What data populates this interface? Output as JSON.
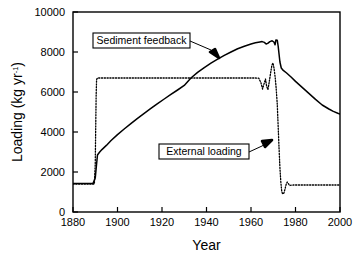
{
  "chart_data": {
    "type": "line",
    "title": "",
    "xlabel": "Year",
    "ylabel": "Loading (kg yr-1)",
    "ylabel_base": "Loading (kg yr",
    "ylabel_sup": "-1",
    "ylabel_close": ")",
    "xlim": [
      1880,
      2000
    ],
    "ylim": [
      0,
      10000
    ],
    "xticks": [
      1880,
      1900,
      1920,
      1940,
      1960,
      1980,
      2000
    ],
    "yticks": [
      0,
      2000,
      4000,
      6000,
      8000,
      10000
    ],
    "grid": false,
    "legend": "none",
    "annotations": [
      {
        "name": "sediment-feedback",
        "label": "Sediment feedback",
        "box_x": 93,
        "box_y": 33,
        "box_w": 97,
        "box_h": 15,
        "leader": "190,41 L 211,50 L 219,58",
        "arrow": "219,58 210,52 215,49"
      },
      {
        "name": "external-loading",
        "label": "External loading",
        "box_x": 159,
        "box_y": 144,
        "box_w": 90,
        "box_h": 15,
        "leader": "249,152 L 262,146 L 272,140",
        "arrow": "272,140 262,141 265,147"
      }
    ],
    "series": [
      {
        "name": "Sediment feedback",
        "style": "solid",
        "color": "#000000",
        "points": [
          [
            1880,
            1420
          ],
          [
            1884,
            1420
          ],
          [
            1887,
            1420
          ],
          [
            1889,
            1430
          ],
          [
            1890,
            1700
          ],
          [
            1890.6,
            2400
          ],
          [
            1891,
            2850
          ],
          [
            1892,
            3000
          ],
          [
            1893,
            3120
          ],
          [
            1895,
            3330
          ],
          [
            1897,
            3560
          ],
          [
            1900,
            3870
          ],
          [
            1903,
            4150
          ],
          [
            1906,
            4420
          ],
          [
            1909,
            4680
          ],
          [
            1912,
            4930
          ],
          [
            1915,
            5180
          ],
          [
            1918,
            5420
          ],
          [
            1921,
            5650
          ],
          [
            1924,
            5880
          ],
          [
            1927,
            6100
          ],
          [
            1930,
            6330
          ],
          [
            1933,
            6700
          ],
          [
            1936,
            6980
          ],
          [
            1939,
            7220
          ],
          [
            1942,
            7440
          ],
          [
            1945,
            7640
          ],
          [
            1948,
            7830
          ],
          [
            1951,
            8000
          ],
          [
            1954,
            8160
          ],
          [
            1957,
            8290
          ],
          [
            1960,
            8400
          ],
          [
            1962,
            8460
          ],
          [
            1964,
            8500
          ],
          [
            1965,
            8520
          ],
          [
            1966,
            8480
          ],
          [
            1966.8,
            8400
          ],
          [
            1967.5,
            8430
          ],
          [
            1968.5,
            8520
          ],
          [
            1969.5,
            8560
          ],
          [
            1970.3,
            8500
          ],
          [
            1970.8,
            8360
          ],
          [
            1971.2,
            8600
          ],
          [
            1971.8,
            8590
          ],
          [
            1972.2,
            8300
          ],
          [
            1972.6,
            7900
          ],
          [
            1973,
            7500
          ],
          [
            1973.6,
            7200
          ],
          [
            1974.5,
            7080
          ],
          [
            1976,
            6950
          ],
          [
            1978,
            6750
          ],
          [
            1980,
            6530
          ],
          [
            1983,
            6230
          ],
          [
            1986,
            5930
          ],
          [
            1989,
            5630
          ],
          [
            1992,
            5350
          ],
          [
            1995,
            5150
          ],
          [
            1997,
            5030
          ],
          [
            1999,
            4940
          ],
          [
            2000,
            4900
          ]
        ]
      },
      {
        "name": "External loading",
        "style": "dotted",
        "color": "#000000",
        "points": [
          [
            1880,
            1400
          ],
          [
            1885,
            1400
          ],
          [
            1888,
            1400
          ],
          [
            1889.6,
            1400
          ],
          [
            1890,
            2400
          ],
          [
            1890.2,
            4200
          ],
          [
            1890.4,
            5800
          ],
          [
            1890.6,
            6620
          ],
          [
            1891,
            6700
          ],
          [
            1895,
            6700
          ],
          [
            1900,
            6700
          ],
          [
            1910,
            6700
          ],
          [
            1920,
            6700
          ],
          [
            1930,
            6700
          ],
          [
            1940,
            6700
          ],
          [
            1950,
            6700
          ],
          [
            1958,
            6700
          ],
          [
            1962,
            6700
          ],
          [
            1963.5,
            6690
          ],
          [
            1964.5,
            6450
          ],
          [
            1965.2,
            6150
          ],
          [
            1965.9,
            6420
          ],
          [
            1966.5,
            6650
          ],
          [
            1967,
            6300
          ],
          [
            1967.6,
            6120
          ],
          [
            1968.2,
            6500
          ],
          [
            1968.8,
            6950
          ],
          [
            1969.4,
            7350
          ],
          [
            1969.9,
            7450
          ],
          [
            1970.4,
            7150
          ],
          [
            1970.9,
            6700
          ],
          [
            1971.3,
            6200
          ],
          [
            1971.8,
            5400
          ],
          [
            1972.2,
            4300
          ],
          [
            1972.6,
            3200
          ],
          [
            1973,
            2200
          ],
          [
            1973.4,
            1500
          ],
          [
            1973.8,
            1050
          ],
          [
            1974.2,
            900
          ],
          [
            1974.8,
            950
          ],
          [
            1975.3,
            1150
          ],
          [
            1975.8,
            1380
          ],
          [
            1976.3,
            1500
          ],
          [
            1976.8,
            1420
          ],
          [
            1977.4,
            1320
          ],
          [
            1978,
            1340
          ],
          [
            1979,
            1350
          ],
          [
            1982,
            1350
          ],
          [
            1986,
            1350
          ],
          [
            1990,
            1350
          ],
          [
            1994,
            1350
          ],
          [
            1998,
            1350
          ],
          [
            2000,
            1350
          ]
        ]
      }
    ]
  },
  "plot": {
    "left": 73,
    "right": 340,
    "top": 12,
    "bottom": 212
  }
}
